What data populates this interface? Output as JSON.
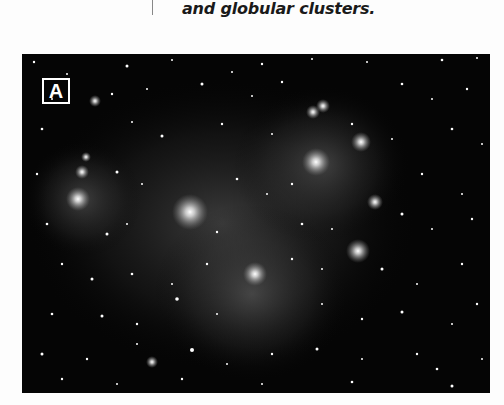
{
  "text": {
    "caption_line": "and globular clusters."
  },
  "figure": {
    "panel_label": "A",
    "colors": {
      "background": "#050505",
      "stars": "#ffffff",
      "label_border": "#ffffff"
    }
  }
}
